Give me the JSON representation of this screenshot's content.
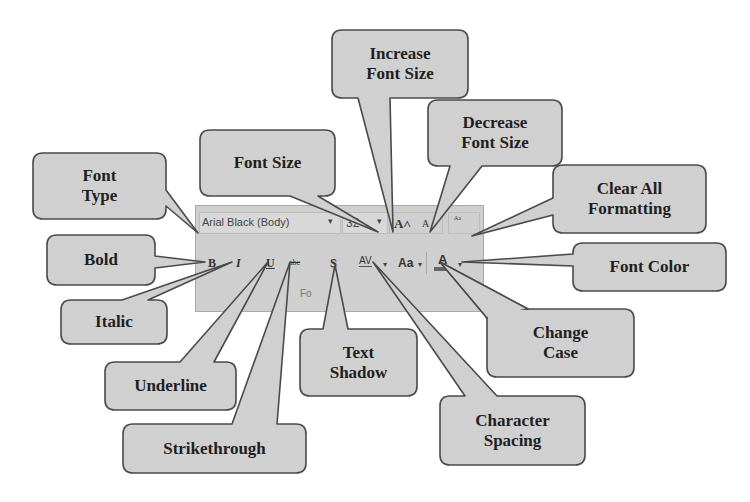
{
  "ribbon": {
    "font_name": "Arial Black (Body)",
    "font_name_dropdown_arrow": "▾",
    "font_size": "32",
    "font_size_dropdown_arrow": "▾",
    "grow_font_glyph": "A˄",
    "shrink_font_glyph": "A",
    "clear_format_glyph": "ᴬᵃ",
    "bold_glyph": "B",
    "italic_glyph": "I",
    "underline_glyph": "U",
    "strike_glyph": "abc",
    "shadow_glyph": "S",
    "spacing_glyph": "AV",
    "spacing_arrow": "▾",
    "case_glyph": "Aa",
    "case_arrow": "▾",
    "color_glyph": "A",
    "color_arrow": "▾",
    "group_label": "Fo"
  },
  "callouts": [
    {
      "id": "font-type",
      "label_line1": "Font",
      "label_line2": "Type"
    },
    {
      "id": "font-size",
      "label_line1": "Font Size",
      "label_line2": ""
    },
    {
      "id": "increase-font-size",
      "label_line1": "Increase",
      "label_line2": "Font Size"
    },
    {
      "id": "decrease-font-size",
      "label_line1": "Decrease",
      "label_line2": "Font Size"
    },
    {
      "id": "clear-all-formatting",
      "label_line1": "Clear All",
      "label_line2": "Formatting"
    },
    {
      "id": "bold",
      "label_line1": "Bold",
      "label_line2": ""
    },
    {
      "id": "font-color",
      "label_line1": "Font Color",
      "label_line2": ""
    },
    {
      "id": "italic",
      "label_line1": "Italic",
      "label_line2": ""
    },
    {
      "id": "change-case",
      "label_line1": "Change",
      "label_line2": "Case"
    },
    {
      "id": "underline",
      "label_line1": "Underline",
      "label_line2": ""
    },
    {
      "id": "text-shadow",
      "label_line1": "Text",
      "label_line2": "Shadow"
    },
    {
      "id": "strikethrough",
      "label_line1": "Strikethrough",
      "label_line2": ""
    },
    {
      "id": "character-spacing",
      "label_line1": "Character",
      "label_line2": "Spacing"
    }
  ],
  "colors": {
    "callout_fill": "#d0d0d0",
    "callout_stroke": "#555555",
    "ribbon_fill": "#cfcfcf",
    "text": "#1f1f1f"
  }
}
